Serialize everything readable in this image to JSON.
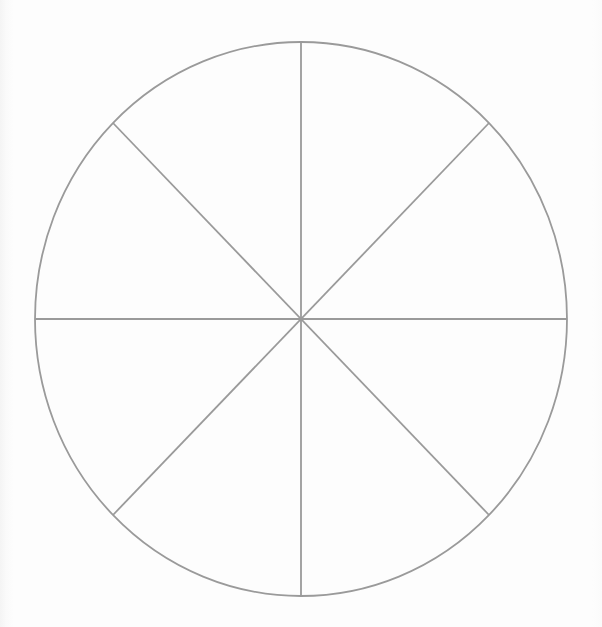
{
  "page": {
    "background_color": "#fdfdfd",
    "width": 602,
    "height": 627
  },
  "figure": {
    "name": "blank-pie-chart",
    "line_color": "#9a9a9a",
    "line_width": 1.8,
    "fill_color": "none",
    "center_x": 301,
    "center_y": 319,
    "radius_x": 266,
    "radius_y": 277,
    "sector_count": 8,
    "sector_angle_degrees": 45,
    "divider_count": 4
  },
  "chart_data": {
    "type": "pie",
    "title": "",
    "subtitle": "",
    "labels": [
      "",
      "",
      "",
      "",
      "",
      "",
      "",
      ""
    ],
    "values": [
      12.5,
      12.5,
      12.5,
      12.5,
      12.5,
      12.5,
      12.5,
      12.5
    ],
    "units": "percent",
    "total": 100,
    "slice_colors": [
      "none",
      "none",
      "none",
      "none",
      "none",
      "none",
      "none",
      "none"
    ],
    "stroke_color": "#9a9a9a",
    "legend": [],
    "legend_position": "none",
    "annotations": [],
    "data_labels_shown": false
  },
  "dividers": [
    {
      "name": "vertical-diameter",
      "angle_degrees": 90,
      "x1": 301,
      "y1": 42,
      "x2": 301,
      "y2": 596
    },
    {
      "name": "horizontal-diameter",
      "angle_degrees": 0,
      "x1": 35,
      "y1": 319,
      "x2": 567,
      "y2": 319
    },
    {
      "name": "diagonal-diameter-nw-se",
      "angle_degrees": 135,
      "x1": 113,
      "y1": 123,
      "x2": 489,
      "y2": 515
    },
    {
      "name": "diagonal-diameter-ne-sw",
      "angle_degrees": 45,
      "x1": 489,
      "y1": 123,
      "x2": 113,
      "y2": 515
    }
  ]
}
